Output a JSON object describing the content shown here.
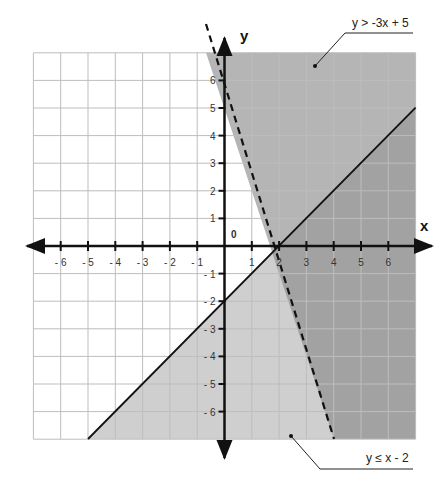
{
  "chart_data": {
    "type": "line",
    "title": "",
    "xlabel": "x",
    "ylabel": "y",
    "xlim": [
      -7,
      7
    ],
    "ylim": [
      -7,
      7
    ],
    "grid": true,
    "origin_label": "0",
    "x_ticks": [
      -6,
      -5,
      -4,
      -3,
      -2,
      -1,
      1,
      2,
      3,
      4,
      5,
      6
    ],
    "x_tick_labels": [
      "- 6",
      "- 5",
      "- 4",
      "- 3",
      "- 2",
      "- 1",
      "1",
      "2",
      "3",
      "4",
      "5",
      "6"
    ],
    "y_ticks": [
      6,
      5,
      4,
      3,
      2,
      1,
      -1,
      -2,
      -3,
      -4,
      -5,
      -6
    ],
    "y_tick_labels": [
      "6",
      "5",
      "4",
      "3",
      "2",
      "1",
      "- 1",
      "- 2",
      "- 3",
      "- 4",
      "- 5",
      "- 6"
    ],
    "series": [
      {
        "name": "y > -3x + 5",
        "equation": "y = -3x + 5",
        "slope": -3,
        "intercept": 5,
        "line_style": "dashed",
        "shaded": "above",
        "x": [
          -0.67,
          4
        ],
        "y": [
          7,
          -7
        ]
      },
      {
        "name": "y ≤ x - 2",
        "equation": "y = x - 2",
        "slope": 1,
        "intercept": -2,
        "line_style": "solid",
        "shaded": "below",
        "x": [
          -5,
          7
        ],
        "y": [
          -7,
          5
        ]
      }
    ],
    "annotations": [
      {
        "text": "y > -3x + 5",
        "position": "top-right"
      },
      {
        "text": "y ≤ x - 2",
        "position": "bottom-right"
      }
    ],
    "colors": {
      "region_above_dashed": "#b5b5b5",
      "region_below_solid": "#cfcfcf",
      "region_overlap": "#a2a2a2",
      "grid": "#bdbdbd",
      "axis": "#111111"
    }
  },
  "labels": {
    "x_axis": "x",
    "y_axis": "y",
    "origin": "0",
    "ineq_top": "y > -3x + 5",
    "ineq_bottom": "y ≤ x - 2",
    "x_ticks": [
      "- 6",
      "- 5",
      "- 4",
      "- 3",
      "- 2",
      "- 1",
      "1",
      "2",
      "3",
      "4",
      "5",
      "6"
    ],
    "y_ticks": [
      "6",
      "5",
      "4",
      "3",
      "2",
      "1",
      "- 1",
      "- 2",
      "- 3",
      "- 4",
      "- 5",
      "- 6"
    ]
  }
}
